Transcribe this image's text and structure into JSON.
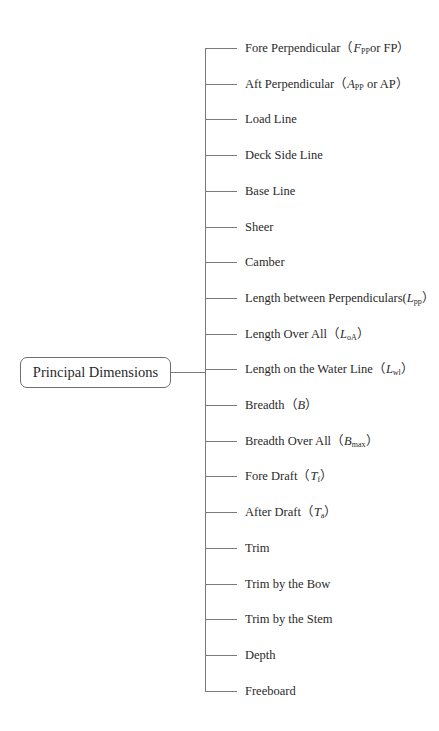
{
  "root": {
    "label": "Principal Dimensions"
  },
  "branches": [
    {
      "pre": "Fore Perpendicular（",
      "sym": "F",
      "sub": "PP",
      "post": "or FP）"
    },
    {
      "pre": "Aft Perpendicular（",
      "sym": "A",
      "sub": "PP",
      "post": " or AP）"
    },
    {
      "pre": "Load Line",
      "sym": "",
      "sub": "",
      "post": ""
    },
    {
      "pre": "Deck Side Line",
      "sym": "",
      "sub": "",
      "post": ""
    },
    {
      "pre": "Base Line",
      "sym": "",
      "sub": "",
      "post": ""
    },
    {
      "pre": "Sheer",
      "sym": "",
      "sub": "",
      "post": ""
    },
    {
      "pre": "Camber",
      "sym": "",
      "sub": "",
      "post": ""
    },
    {
      "pre": "Length between Perpendiculars(",
      "sym": "L",
      "sub": "pp",
      "post": "）"
    },
    {
      "pre": "Length Over All（",
      "sym": "L",
      "sub": "oA",
      "post": "）"
    },
    {
      "pre": "Length on the Water Line（",
      "sym": "L",
      "sub": "wl",
      "post": "）"
    },
    {
      "pre": "Breadth（",
      "sym": "B",
      "sub": "",
      "post": "）"
    },
    {
      "pre": "Breadth Over All（",
      "sym": "B",
      "sub": "max",
      "post": "）"
    },
    {
      "pre": "Fore Draft（",
      "sym": "T",
      "sub": "f",
      "post": "）"
    },
    {
      "pre": "After Draft（",
      "sym": "T",
      "sub": "a",
      "post": "）"
    },
    {
      "pre": "Trim",
      "sym": "",
      "sub": "",
      "post": ""
    },
    {
      "pre": "Trim by the Bow",
      "sym": "",
      "sub": "",
      "post": ""
    },
    {
      "pre": "Trim by the Stem",
      "sym": "",
      "sub": "",
      "post": ""
    },
    {
      "pre": "Depth",
      "sym": "",
      "sub": "",
      "post": ""
    },
    {
      "pre": "Freeboard",
      "sym": "",
      "sub": "",
      "post": ""
    }
  ],
  "colors": {
    "line": "#7a7a7a",
    "text": "#2a2a2a",
    "box_border": "#6e6e6e"
  }
}
